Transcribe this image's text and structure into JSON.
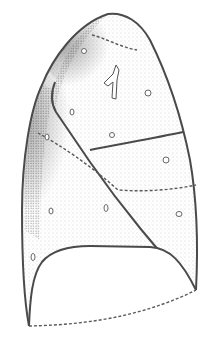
{
  "illustration": {
    "subject": "lung lateral view line drawing",
    "colors": {
      "background": "#ffffff",
      "outline": "#4a4a4a",
      "stipple": "#8a8a8a",
      "shade": "#6a6a6a"
    },
    "lobes": [
      "upper-lobe",
      "middle-lobe",
      "lower-lobe"
    ],
    "marks": {
      "fissures": [
        "horizontal-fissure",
        "oblique-fissure"
      ],
      "dashed_lines": [
        "apical-dashed",
        "lower-dashed",
        "base-dashed"
      ]
    }
  }
}
